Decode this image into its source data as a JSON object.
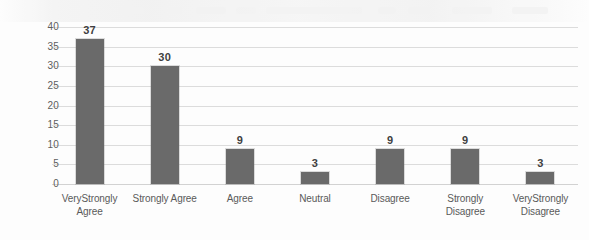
{
  "chart_data": {
    "type": "bar",
    "title": "",
    "subtitle": "",
    "xlabel": "",
    "ylabel": "",
    "categories": [
      "VeryStrongly Agree",
      "Strongly Agree",
      "Agree",
      "Neutral",
      "Disagree",
      "Strongly Disagree",
      "VeryStrongly Disagree"
    ],
    "category_lines": [
      [
        "VeryStrongly",
        "Agree"
      ],
      [
        "Strongly Agree",
        ""
      ],
      [
        "Agree",
        ""
      ],
      [
        "Neutral",
        ""
      ],
      [
        "Disagree",
        ""
      ],
      [
        "Strongly",
        "Disagree"
      ],
      [
        "VeryStrongly",
        "Disagree"
      ]
    ],
    "values": [
      37,
      30,
      9,
      3,
      9,
      9,
      3
    ],
    "data_labels": [
      "37",
      "30",
      "9",
      "3",
      "9",
      "9",
      "3"
    ],
    "ylim": [
      0,
      40
    ],
    "ytick_step": 5,
    "ytick_labels": [
      "40",
      "35",
      "30",
      "25",
      "20",
      "15",
      "10",
      "5",
      "0"
    ],
    "ytick_values": [
      40,
      35,
      30,
      25,
      20,
      15,
      10,
      5,
      0
    ],
    "grid": true,
    "grid_axis": "y",
    "legend": false,
    "legend_position": "none",
    "series": [
      {
        "name": "",
        "values": [
          37,
          30,
          9,
          3,
          9,
          9,
          3
        ]
      }
    ]
  },
  "colors": {
    "bar": "#6a6a6a",
    "gridline": "#dcdcdc",
    "baseline": "#d2d2d2",
    "tick_text": "#5d5d5d",
    "label_text": "#5a5a5a",
    "value_text": "#3f3f3f",
    "background": "#fdfdfd"
  }
}
